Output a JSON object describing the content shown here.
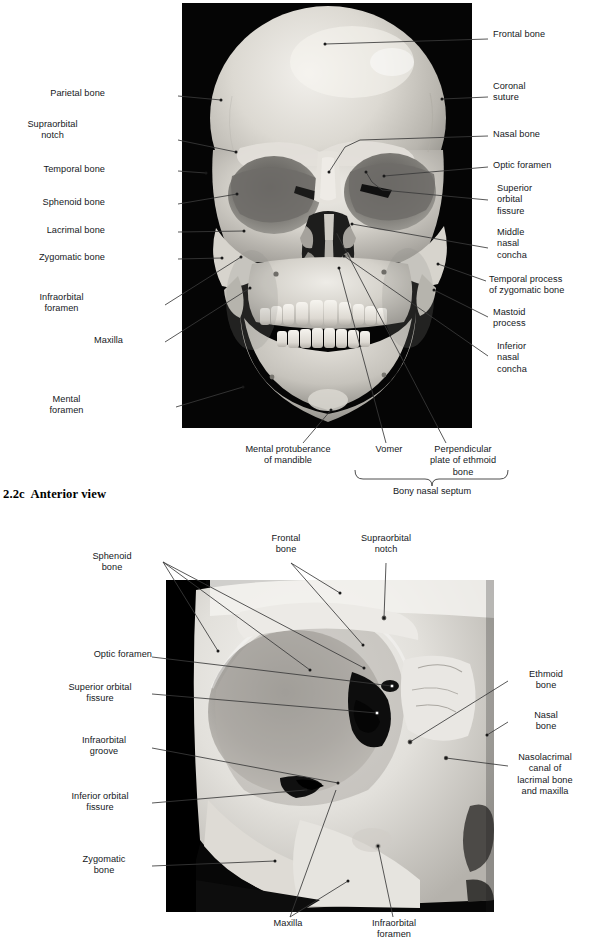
{
  "page": {
    "width": 592,
    "height": 944,
    "background": "#ffffff",
    "text_color": "#15181c",
    "leader_color": "#3a3a3a"
  },
  "figures": [
    {
      "id": "figure-anterior",
      "caption_number": "2.2c",
      "caption_title": "Anterior view",
      "caption_full": "2.2c  Anterior view",
      "photo": {
        "name": "skull-anterior-photograph",
        "description": "Photograph of a human skull, anterior (frontal) view, on black background",
        "x": 182,
        "y": 3,
        "width": 290,
        "height": 425,
        "background": "#000000",
        "bone_light": "#e9e7e2",
        "bone_mid": "#c9c6bf",
        "bone_shadow": "#8d8b85",
        "cavity_dark": "#2a2a28"
      },
      "labels_left": [
        {
          "text": "Parietal bone",
          "x": 105,
          "y": 92
        },
        {
          "text": "Supraorbital\nnotch",
          "x": 105,
          "y": 122
        },
        {
          "text": "Temporal bone",
          "x": 105,
          "y": 167
        },
        {
          "text": "Sphenoid bone",
          "x": 105,
          "y": 200
        },
        {
          "text": "Lacrimal bone",
          "x": 105,
          "y": 228
        },
        {
          "text": "Zygomatic bone",
          "x": 105,
          "y": 255
        },
        {
          "text": "Infraorbital\nforamen",
          "x": 123,
          "y": 296
        },
        {
          "text": "Maxilla",
          "x": 123,
          "y": 338
        },
        {
          "text": "Mental\nforamen",
          "x": 133,
          "y": 398
        }
      ],
      "labels_right": [
        {
          "text": "Frontal bone",
          "x": 493,
          "y": 33
        },
        {
          "text": "Coronal\nsuture",
          "x": 493,
          "y": 84
        },
        {
          "text": "Nasal bone",
          "x": 493,
          "y": 132
        },
        {
          "text": "Optic foramen",
          "x": 493,
          "y": 163
        },
        {
          "text": "Superior\norbital\nfissure",
          "x": 497,
          "y": 186
        },
        {
          "text": "Middle\nnasal\nconcha",
          "x": 497,
          "y": 230
        },
        {
          "text": "Temporal process\nof zygomatic bone",
          "x": 489,
          "y": 277
        },
        {
          "text": "Mastoid\nprocess",
          "x": 493,
          "y": 310
        },
        {
          "text": "Inferior\nnasal\nconcha",
          "x": 497,
          "y": 344
        }
      ],
      "labels_bottom": [
        {
          "text": "Mental protuberance\nof mandible",
          "x": 288,
          "y": 447,
          "align": "center"
        },
        {
          "text": "Vomer",
          "x": 389,
          "y": 447,
          "align": "center"
        },
        {
          "text": "Perpendicular\nplate of ethmoid\nbone",
          "x": 462,
          "y": 447,
          "align": "center"
        }
      ],
      "bracket": {
        "name": "bony-nasal-septum-bracket",
        "label": "Bony nasal septum",
        "x_left": 355,
        "x_right": 508,
        "y": 478,
        "label_x": 432,
        "label_y": 492
      }
    },
    {
      "id": "figure-orbital",
      "caption_number": "2.3",
      "caption_title": "The orbital complex",
      "caption_full": "2.3  The orbital complex",
      "photo": {
        "name": "orbital-complex-photograph",
        "description": "Close-up photograph of the left orbital complex of a human skull",
        "x": 166,
        "y": 580,
        "width": 328,
        "height": 332,
        "background": "#000000",
        "bone_light": "#efeeea",
        "bone_mid": "#d2d0ca",
        "bone_shadow": "#9a9893",
        "cavity_dark": "#3c3b39"
      },
      "labels_top": [
        {
          "text": "Frontal\nbone",
          "x": 285,
          "y": 537,
          "align": "center"
        },
        {
          "text": "Supraorbital\nnotch",
          "x": 385,
          "y": 537,
          "align": "center"
        }
      ],
      "labels_left": [
        {
          "text": "Sphenoid\nbone",
          "x": 158,
          "y": 555
        },
        {
          "text": "Optic foramen",
          "x": 158,
          "y": 653
        },
        {
          "text": "Superior orbital\nfissure",
          "x": 158,
          "y": 686
        },
        {
          "text": "Infraorbital\ngroove",
          "x": 158,
          "y": 739
        },
        {
          "text": "Inferior orbital\nfissure",
          "x": 158,
          "y": 795
        },
        {
          "text": "Zygomatic\nbone",
          "x": 158,
          "y": 858
        }
      ],
      "labels_right": [
        {
          "text": "Ethmoid\nbone",
          "x": 513,
          "y": 673
        },
        {
          "text": "Nasal\nbone",
          "x": 513,
          "y": 714
        },
        {
          "text": "Nasolacrimal\ncanal of\nlacrimal bone\nand maxilla",
          "x": 513,
          "y": 756
        }
      ],
      "labels_bottom": [
        {
          "text": "Maxilla",
          "x": 288,
          "y": 922,
          "align": "center"
        },
        {
          "text": "Infraorbital\nforamen",
          "x": 395,
          "y": 922,
          "align": "center"
        }
      ]
    }
  ]
}
